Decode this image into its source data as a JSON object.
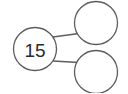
{
  "figure": {
    "name": "number-bond",
    "type": "number-bond-diagram",
    "title": "",
    "background_color": "#ffffff"
  },
  "style": {
    "stroke_color": "#5d5d5d",
    "stroke_width": 1.3,
    "circle_fill": "#ffffff",
    "text_color": "#2b2b2b",
    "connector_color": "#5d5d5d"
  },
  "nodes": {
    "whole": {
      "label": "15",
      "role": "whole",
      "cx": 35,
      "cy": 49,
      "r": 21.5,
      "filled": true
    },
    "part_top": {
      "label": "",
      "role": "part",
      "cx": 96,
      "cy": 23,
      "r": 21.5,
      "filled": false
    },
    "part_bottom": {
      "label": "",
      "role": "part",
      "cx": 96,
      "cy": 72,
      "r": 21.5,
      "filled": false
    }
  },
  "connectors": [
    {
      "name": "whole-to-part-top",
      "from": "whole",
      "to": "part_top",
      "x1": 53,
      "y1": 37,
      "x2": 78,
      "y2": 34
    },
    {
      "name": "whole-to-part-bottom",
      "from": "whole",
      "to": "part_bottom",
      "x1": 53,
      "y1": 61,
      "x2": 78,
      "y2": 62
    }
  ]
}
